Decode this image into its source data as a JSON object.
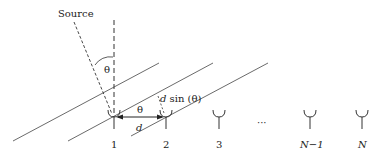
{
  "source_label": "Source",
  "angle_symbol": "θ",
  "spacing_label": "d",
  "path_diff_label_d": "d",
  "path_diff_label_rest": " sin (θ)",
  "ellipsis": "···",
  "elements": [
    {
      "label": "1",
      "x": 114
    },
    {
      "label": "2",
      "x": 166
    },
    {
      "label": "3",
      "x": 219
    },
    {
      "label": "N−1",
      "x": 310
    },
    {
      "label": "N",
      "x": 362
    }
  ],
  "colors": {
    "line": "#333333",
    "text": "#222222"
  }
}
